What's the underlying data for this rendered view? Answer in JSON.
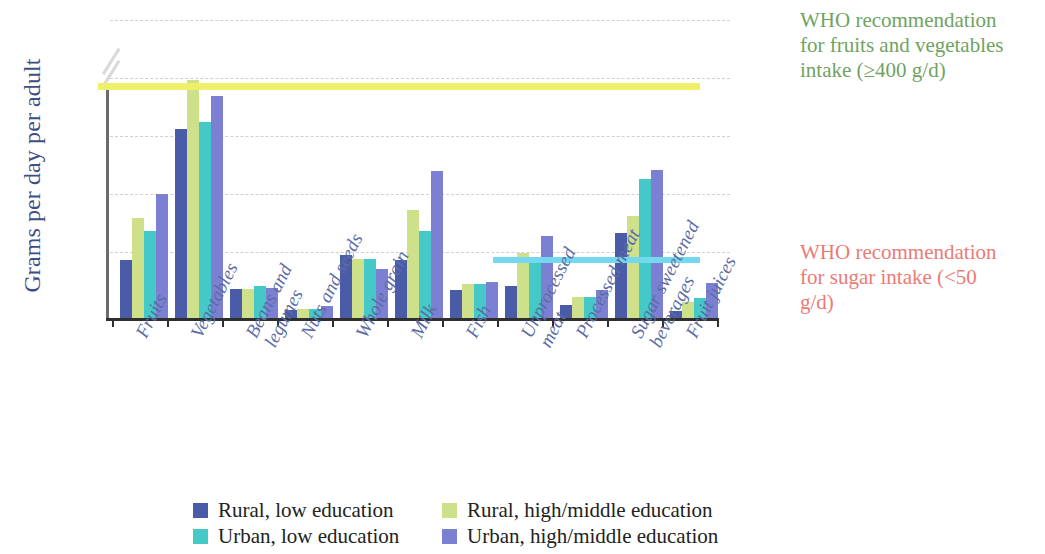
{
  "chart_data": {
    "type": "bar",
    "title": "",
    "xlabel": "",
    "ylabel": "Grams per day per adult",
    "ylim": [
      0,
      200
    ],
    "y_axis_break": true,
    "y_ticks": [
      "0",
      "50",
      "100",
      "150",
      "200",
      "400"
    ],
    "grid": true,
    "legend_position": "bottom",
    "categories": [
      "Fruits",
      "Vegetables",
      "Beans and legumes",
      "Nuts and seeds",
      "Whole grain",
      "Milk",
      "Fish",
      "Unprocessed meat",
      "Processed meat",
      "Sugar sweetened beverages",
      "Fruit juices"
    ],
    "series": [
      {
        "name": "Rural, low education",
        "color": "#4a5ba8",
        "values": [
          50,
          163,
          25,
          7,
          54,
          50,
          24,
          28,
          11,
          73,
          6
        ]
      },
      {
        "name": "Rural, high/middle education",
        "color": "#cfe08a",
        "values": [
          86,
          205,
          25,
          8,
          51,
          93,
          29,
          56,
          18,
          88,
          14
        ]
      },
      {
        "name": "Urban, low education",
        "color": "#45c8c8",
        "values": [
          75,
          169,
          28,
          8,
          51,
          75,
          29,
          48,
          18,
          120,
          17
        ]
      },
      {
        "name": "Urban, high/middle education",
        "color": "#7b80d2",
        "values": [
          107,
          191,
          26,
          10,
          42,
          127,
          31,
          71,
          24,
          128,
          30
        ]
      }
    ],
    "reference_lines": [
      {
        "name": "who-fruit-vegetables",
        "value": 200,
        "color": "#eef06a",
        "annotation": "WHO recommendation for fruits and vegetables intake (≥400 g/d)",
        "annotation_color": "#6fa361"
      },
      {
        "name": "who-sugar",
        "value": 50,
        "color": "#74d8ef",
        "annotation": "WHO recommendation for sugar intake (<50 g/d)",
        "annotation_color": "#ec7a75"
      }
    ]
  },
  "annotations": {
    "who_vegetables": "WHO recommendation for fruits and vegetables intake (≥400 g/d)",
    "who_sugar": "WHO recommendation for sugar intake (<50 g/d)"
  },
  "legend": {
    "items": [
      {
        "label": "Rural, low education",
        "color": "#4a5ba8"
      },
      {
        "label": "Rural, high/middle education",
        "color": "#cfe08a"
      },
      {
        "label": "Urban, low education",
        "color": "#45c8c8"
      },
      {
        "label": "Urban, high/middle education",
        "color": "#7b80d2"
      }
    ]
  }
}
